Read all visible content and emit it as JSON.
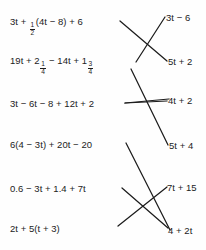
{
  "worksheet": {
    "type": "matching-diagram",
    "background_color": "#fefefe",
    "ink_color": "#1c1c1c",
    "left_column": [
      {
        "id": "l1",
        "text": "3t + ½(4t − 8) + 6",
        "parts": {
          "pre": "3t + ",
          "frac_num": "1",
          "frac_den": "2",
          "post": "(4t − 8) + 6"
        }
      },
      {
        "id": "l2",
        "text": "19t + 2¼ − 14t + 1¾",
        "parts": {
          "pre": "19t + 2",
          "frac_num": "1",
          "frac_den": "4",
          "mid": " − 14t + 1",
          "frac2_num": "3",
          "frac2_den": "4",
          "post": ""
        }
      },
      {
        "id": "l3",
        "text": "3t − 6t − 8 + 12t + 2"
      },
      {
        "id": "l4",
        "text": "6(4 − 3t) + 20t − 20"
      },
      {
        "id": "l5",
        "text": "0.6 − 3t + 1.4 + 7t"
      },
      {
        "id": "l6",
        "text": "2t + 5(t + 3)"
      }
    ],
    "right_column": [
      {
        "id": "r1",
        "text": "3t − 6"
      },
      {
        "id": "r2",
        "text": "5t + 2"
      },
      {
        "id": "r3",
        "text": "4t + 2"
      },
      {
        "id": "r4",
        "text": "5t + 4"
      },
      {
        "id": "r5",
        "text": "7t + 15"
      },
      {
        "id": "r6",
        "text": "4 + 2t"
      }
    ],
    "connections": [
      {
        "from": "l1",
        "to": "r2"
      },
      {
        "from": "l2",
        "to": "r1"
      },
      {
        "from": "l3",
        "to": "r3"
      },
      {
        "from": "l2b",
        "to": "r4"
      },
      {
        "from": "l5",
        "to": "r6"
      },
      {
        "from": "l6",
        "to": "r5"
      },
      {
        "from": "l4",
        "to": "r5b"
      }
    ]
  }
}
